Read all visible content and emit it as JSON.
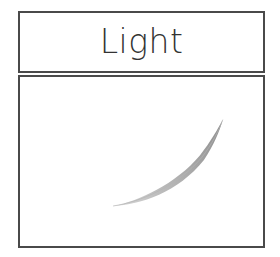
{
  "page": {
    "width": 280,
    "height": 257,
    "background_color": "#ffffff"
  },
  "card": {
    "border_color": "#4a4a4a",
    "border_width_px": 2,
    "fill_color": "#ffffff",
    "x": 18,
    "y": 11,
    "width": 247,
    "height": 237
  },
  "header": {
    "title": "Light",
    "text_color": "#333333",
    "font_size_px": 33,
    "font_weight": "light",
    "align": "center",
    "box_height_px": 62
  },
  "content": {
    "box_height_px": 173,
    "background_color": "#ffffff",
    "illustration": {
      "name": "tapered-brush-stroke-curve",
      "description": "A single tapered gray brush stroke curving upward from lower-left to upper-right, thin at the tail and thickest near the upper-right tip.",
      "stroke_color_light": "#c9c9c9",
      "stroke_color_mid": "#a8a8a8",
      "stroke_color_dark": "#8f8f8f",
      "start_point": [
        113,
        196
      ],
      "end_point": [
        224,
        108
      ],
      "max_width_px": 3.2,
      "min_width_px": 0.3,
      "curvature": "convex-down"
    }
  }
}
